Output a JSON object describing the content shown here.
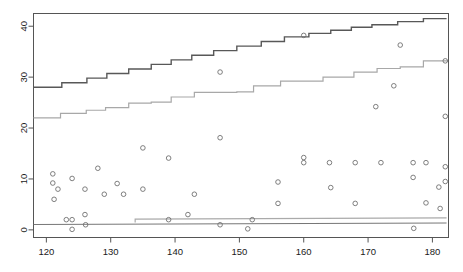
{
  "chart_data": {
    "type": "scatter",
    "title": "",
    "subtitle": "",
    "xlabel": "",
    "ylabel": "",
    "xlim": [
      118,
      182.5
    ],
    "ylim": [
      -1.5,
      42.5
    ],
    "grid": false,
    "legend": null,
    "xticks": [
      120,
      130,
      140,
      150,
      160,
      170,
      180
    ],
    "yticks": [
      0,
      10,
      20,
      30,
      40
    ],
    "xtick_labels": [
      "120",
      "130",
      "140",
      "150",
      "160",
      "170",
      "180"
    ],
    "ytick_labels": [
      "0",
      "10",
      "20",
      "30",
      "40"
    ],
    "axis_box": true,
    "colors": {
      "upper_step": "#585858",
      "lower_step": "#a8a8a8",
      "baseline_dark": "#777777",
      "baseline_light": "#aaaaaa",
      "point_stroke": "#707070",
      "axis": "#555555",
      "background": "#ffffff"
    },
    "series": [
      {
        "name": "scatter-points",
        "type": "scatter",
        "marker": "open-circle",
        "points": [
          [
            121.0,
            11.0
          ],
          [
            121.0,
            9.2
          ],
          [
            121.2,
            6.0
          ],
          [
            121.8,
            8.0
          ],
          [
            123.1,
            2.0
          ],
          [
            124.0,
            10.1
          ],
          [
            124.0,
            2.0
          ],
          [
            124.0,
            0.1
          ],
          [
            126.0,
            8.0
          ],
          [
            126.0,
            3.0
          ],
          [
            126.1,
            1.0
          ],
          [
            128.0,
            12.1
          ],
          [
            129.0,
            7.0
          ],
          [
            131.0,
            9.1
          ],
          [
            132.0,
            7.0
          ],
          [
            135.0,
            16.1
          ],
          [
            135.0,
            8.0
          ],
          [
            139.0,
            14.1
          ],
          [
            139.0,
            2.0
          ],
          [
            142.0,
            3.0
          ],
          [
            143.0,
            7.0
          ],
          [
            147.0,
            18.1
          ],
          [
            147.0,
            31.0
          ],
          [
            147.0,
            1.0
          ],
          [
            151.3,
            0.2
          ],
          [
            152.0,
            2.0
          ],
          [
            156.0,
            9.4
          ],
          [
            156.0,
            5.2
          ],
          [
            160.0,
            38.2
          ],
          [
            160.0,
            14.2
          ],
          [
            160.0,
            13.2
          ],
          [
            164.0,
            13.2
          ],
          [
            164.2,
            8.3
          ],
          [
            168.0,
            13.2
          ],
          [
            168.0,
            5.2
          ],
          [
            171.2,
            24.2
          ],
          [
            172.0,
            13.2
          ],
          [
            174.0,
            28.3
          ],
          [
            175.0,
            36.3
          ],
          [
            177.0,
            13.2
          ],
          [
            177.0,
            10.3
          ],
          [
            177.1,
            0.3
          ],
          [
            179.0,
            13.2
          ],
          [
            179.0,
            5.3
          ],
          [
            181.0,
            8.4
          ],
          [
            181.2,
            4.2
          ],
          [
            182.0,
            22.3
          ],
          [
            182.0,
            12.4
          ],
          [
            182.0,
            9.5
          ],
          [
            182.0,
            33.2
          ]
        ]
      },
      {
        "name": "upper-step-line",
        "type": "step",
        "color": "#585858",
        "width": 1.4,
        "points": [
          [
            118.0,
            28.0
          ],
          [
            122.4,
            28.0
          ],
          [
            122.4,
            28.9
          ],
          [
            126.3,
            28.9
          ],
          [
            126.3,
            29.8
          ],
          [
            129.4,
            29.8
          ],
          [
            129.4,
            30.7
          ],
          [
            132.8,
            30.7
          ],
          [
            132.8,
            31.6
          ],
          [
            136.3,
            31.6
          ],
          [
            136.3,
            32.5
          ],
          [
            139.4,
            32.5
          ],
          [
            139.4,
            33.4
          ],
          [
            142.6,
            33.4
          ],
          [
            142.6,
            34.3
          ],
          [
            146.0,
            34.3
          ],
          [
            146.0,
            35.2
          ],
          [
            149.6,
            35.2
          ],
          [
            149.6,
            36.1
          ],
          [
            153.4,
            36.1
          ],
          [
            153.4,
            37.0
          ],
          [
            157.0,
            37.0
          ],
          [
            157.0,
            37.9
          ],
          [
            160.8,
            37.9
          ],
          [
            160.8,
            38.6
          ],
          [
            164.2,
            38.6
          ],
          [
            164.2,
            39.2
          ],
          [
            167.4,
            39.2
          ],
          [
            167.4,
            39.8
          ],
          [
            170.6,
            39.8
          ],
          [
            170.6,
            40.3
          ],
          [
            174.6,
            40.3
          ],
          [
            174.6,
            40.9
          ],
          [
            178.6,
            40.9
          ],
          [
            178.6,
            41.5
          ],
          [
            182.2,
            41.5
          ]
        ]
      },
      {
        "name": "lower-step-line",
        "type": "step",
        "color": "#a8a8a8",
        "width": 1.2,
        "points": [
          [
            118.0,
            22.0
          ],
          [
            122.2,
            22.0
          ],
          [
            122.2,
            22.9
          ],
          [
            126.2,
            22.9
          ],
          [
            126.2,
            23.5
          ],
          [
            129.2,
            23.5
          ],
          [
            129.2,
            24.0
          ],
          [
            132.8,
            24.0
          ],
          [
            132.8,
            24.9
          ],
          [
            136.3,
            24.9
          ],
          [
            136.3,
            25.1
          ],
          [
            139.4,
            25.1
          ],
          [
            139.4,
            26.1
          ],
          [
            143.0,
            26.1
          ],
          [
            143.0,
            27.0
          ],
          [
            149.6,
            27.0
          ],
          [
            149.6,
            27.1
          ],
          [
            152.2,
            27.1
          ],
          [
            152.2,
            28.3
          ],
          [
            156.4,
            28.3
          ],
          [
            156.4,
            29.2
          ],
          [
            163.0,
            29.2
          ],
          [
            163.0,
            30.0
          ],
          [
            167.8,
            30.0
          ],
          [
            167.8,
            31.0
          ],
          [
            171.4,
            31.0
          ],
          [
            171.4,
            31.7
          ],
          [
            175.0,
            31.7
          ],
          [
            175.0,
            32.0
          ],
          [
            178.6,
            32.0
          ],
          [
            178.6,
            33.2
          ],
          [
            182.4,
            33.2
          ]
        ]
      },
      {
        "name": "baseline-dark-line",
        "type": "line",
        "color": "#777777",
        "width": 1.2,
        "points": [
          [
            118.0,
            1.05
          ],
          [
            182.2,
            1.35
          ]
        ]
      },
      {
        "name": "baseline-light-line",
        "type": "step",
        "color": "#aaaaaa",
        "width": 1.2,
        "points": [
          [
            133.8,
            1.45
          ],
          [
            133.8,
            2.1
          ],
          [
            182.2,
            2.35
          ]
        ]
      }
    ]
  }
}
